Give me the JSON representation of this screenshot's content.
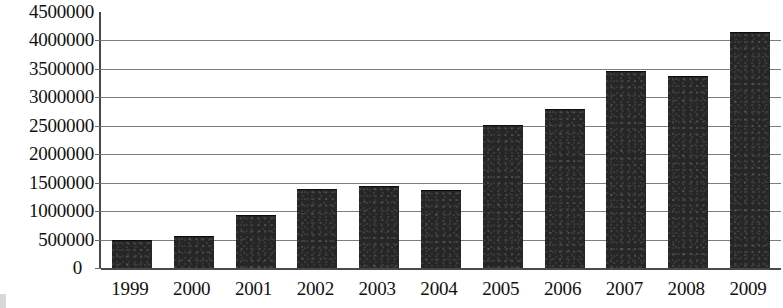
{
  "chart_data": {
    "type": "bar",
    "title": "",
    "xlabel": "",
    "ylabel": "",
    "categories": [
      "1999",
      "2000",
      "2001",
      "2002",
      "2003",
      "2004",
      "2005",
      "2006",
      "2007",
      "2008",
      "2009"
    ],
    "values": [
      480000,
      550000,
      920000,
      1370000,
      1430000,
      1350000,
      2500000,
      2780000,
      3440000,
      3360000,
      4130000
    ],
    "ylim": [
      0,
      4500000
    ],
    "ytick_values": [
      0,
      500000,
      1000000,
      1500000,
      2000000,
      2500000,
      3000000,
      3500000,
      4000000,
      4500000
    ],
    "ytick_labels": [
      "0",
      "500000",
      "1000000",
      "1500000",
      "2000000",
      "2500000",
      "3000000",
      "3500000",
      "4000000",
      "4500000"
    ],
    "grid": true,
    "legend": false,
    "legend_position": "none",
    "bar_color": "#262626",
    "gridline_color": "#7d7d7d",
    "axis_color": "#4a4a4a",
    "background_color": "#ffffff"
  }
}
